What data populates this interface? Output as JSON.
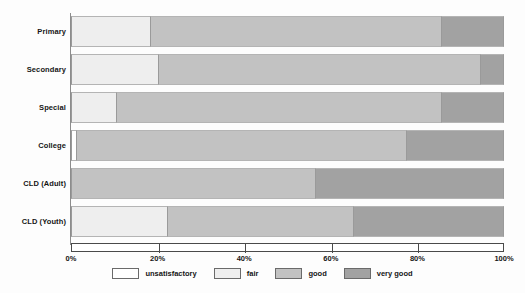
{
  "chart_data": {
    "type": "bar",
    "orientation": "horizontal",
    "stacked": true,
    "normalized": true,
    "title": "",
    "subtitle": "",
    "xlabel": "",
    "ylabel": "",
    "xlim": [
      0,
      100
    ],
    "grid": false,
    "legend_position": "bottom",
    "categories": [
      "Primary",
      "Secondary",
      "Special",
      "College",
      "CLD (Adult)",
      "CLD (Youth)"
    ],
    "xticks": [
      0,
      20,
      40,
      60,
      80,
      100
    ],
    "xtick_labels": [
      "0%",
      "20%",
      "40%",
      "60%",
      "80%",
      "100%"
    ],
    "series": [
      {
        "name": "unsatisfactory",
        "color": "#ffffff",
        "values": [
          0,
          0,
          0,
          1.5,
          0,
          0
        ]
      },
      {
        "name": "fair",
        "color": "#eeeeee",
        "values": [
          18.5,
          20.4,
          10.6,
          0,
          0,
          22.4
        ]
      },
      {
        "name": "good",
        "color": "#c2c2c2",
        "values": [
          67.2,
          74.2,
          75.0,
          76.1,
          56.5,
          42.9
        ]
      },
      {
        "name": "very good",
        "color": "#a2a2a2",
        "values": [
          14.3,
          5.4,
          14.4,
          22.4,
          43.5,
          34.7
        ]
      }
    ]
  },
  "legend": {
    "items": [
      {
        "label": "unsatisfactory",
        "key": "unsatisfactory"
      },
      {
        "label": "fair",
        "key": "fair"
      },
      {
        "label": "good",
        "key": "good"
      },
      {
        "label": "very good",
        "key": "verygood"
      }
    ]
  },
  "colors": {
    "unsatisfactory": "#ffffff",
    "fair": "#eeeeee",
    "good": "#c2c2c2",
    "very_good": "#a2a2a2",
    "axis": "#4a4a4a",
    "text": "#151515",
    "background": "#fdfdfd"
  }
}
